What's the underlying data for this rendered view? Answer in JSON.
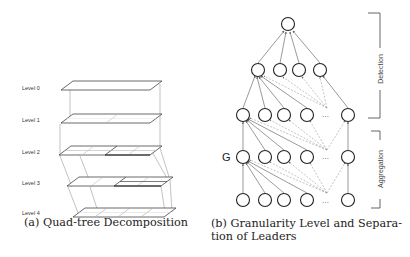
{
  "panel_a": {
    "caption": "(a) Quad-tree Decomposition",
    "levels": [
      {
        "label": "Level 0",
        "y": 87,
        "divisions": 1
      },
      {
        "label": "Level 1",
        "y": 120,
        "divisions": 2
      },
      {
        "label": "Level 2",
        "y": 152,
        "divisions": 4
      },
      {
        "label": "Level 3",
        "y": 183,
        "divisions": 4
      },
      {
        "label": "Level 4",
        "y": 214,
        "divisions": 4
      }
    ]
  },
  "panel_b": {
    "caption": "(b) Granularity Level and Separation of Leaders",
    "caption_line1": "(b) Granularity Level and Separa-",
    "caption_line2": "tion of Leaders",
    "granularity_label": "G",
    "detection_label": "Detection",
    "aggregation_label": "Aggregation",
    "ellipsis": "…"
  }
}
